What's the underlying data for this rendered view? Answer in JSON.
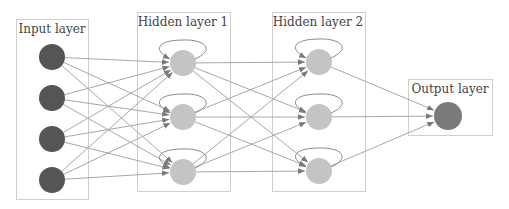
{
  "diagram": {
    "type": "recurrent-neural-network",
    "background": "#ffffff",
    "colors": {
      "input_node": "#555555",
      "hidden_node": "#c4c4c4",
      "output_node": "#7a7a7a",
      "edge": "#a8a8a8",
      "arrowhead": "#7a7a7a",
      "box_border": "#cfcfcf",
      "label_text": "#444444"
    },
    "layers": [
      {
        "id": "input",
        "label": "Input layer",
        "box": {
          "x": 16,
          "y": 19,
          "w": 72,
          "h": 180
        },
        "label_pos": {
          "x": 52,
          "y": 33
        },
        "node_radius": 13,
        "self_loops": false,
        "nodes": [
          {
            "x": 52,
            "y": 57
          },
          {
            "x": 52,
            "y": 98
          },
          {
            "x": 52,
            "y": 139
          },
          {
            "x": 52,
            "y": 180
          }
        ]
      },
      {
        "id": "hidden1",
        "label": "Hidden layer 1",
        "box": {
          "x": 137,
          "y": 12,
          "w": 93,
          "h": 179
        },
        "label_pos": {
          "x": 183,
          "y": 26
        },
        "node_radius": 13,
        "self_loops": true,
        "nodes": [
          {
            "x": 183,
            "y": 63
          },
          {
            "x": 183,
            "y": 117
          },
          {
            "x": 183,
            "y": 172
          }
        ]
      },
      {
        "id": "hidden2",
        "label": "Hidden layer 2",
        "box": {
          "x": 272,
          "y": 12,
          "w": 93,
          "h": 179
        },
        "label_pos": {
          "x": 318,
          "y": 26
        },
        "node_radius": 13,
        "self_loops": true,
        "nodes": [
          {
            "x": 319,
            "y": 62
          },
          {
            "x": 319,
            "y": 117
          },
          {
            "x": 319,
            "y": 171
          }
        ]
      },
      {
        "id": "output",
        "label": "Output layer",
        "box": {
          "x": 408,
          "y": 79,
          "w": 84,
          "h": 56
        },
        "label_pos": {
          "x": 450,
          "y": 93
        },
        "node_radius": 14,
        "self_loops": false,
        "nodes": [
          {
            "x": 448,
            "y": 116
          }
        ]
      }
    ],
    "connections": "fully-connected between consecutive layers; recurrent self-loop on each hidden node"
  }
}
